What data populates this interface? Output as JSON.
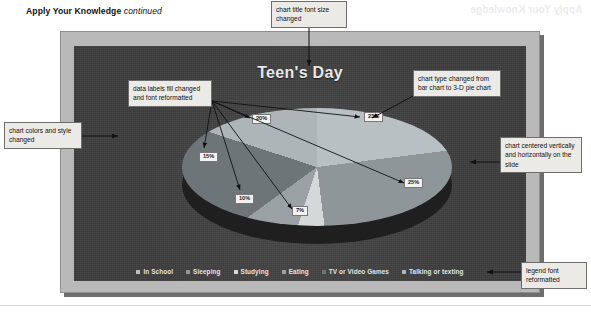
{
  "page": {
    "header_bold": "Apply Your Knowledge",
    "header_italic": "continued",
    "ghost_text": "Apply Your Knowledge"
  },
  "slide": {
    "chart_title": "Teen's Day",
    "background_color": "#3a3a3a"
  },
  "callouts": [
    {
      "name": "chart-title-font",
      "text": "chart title font size changed"
    },
    {
      "name": "chart-type",
      "text": "chart type changed from bar chart to 3-D pie chart"
    },
    {
      "name": "chart-centered",
      "text": "chart centered vertically and horizontally on the slide"
    },
    {
      "name": "chart-colors",
      "text": "chart colors and style changed"
    },
    {
      "name": "data-labels",
      "text": "data labels fill changed and font reformatted"
    },
    {
      "name": "legend-font",
      "text": "legend font reformatted"
    }
  ],
  "chart_data": {
    "type": "pie",
    "title": "Teen's Day",
    "three_d": true,
    "categories": [
      "In School",
      "Sleeping",
      "Studying",
      "Eating",
      "TV or Video Games",
      "Talking or texting"
    ],
    "values": [
      23,
      25,
      7,
      10,
      15,
      20
    ],
    "data_labels": [
      "23%",
      "25%",
      "7%",
      "10%",
      "15%",
      "20%"
    ],
    "colors": [
      "#b9c0c4",
      "#8f9699",
      "#d4d8d9",
      "#9aa1a4",
      "#6e7578",
      "#aeb5b8"
    ],
    "legend_position": "bottom",
    "grid": false,
    "xlabel": "",
    "ylabel": ""
  },
  "legend": [
    {
      "label": "In School",
      "color": "#b9c0c4"
    },
    {
      "label": "Sleeping",
      "color": "#8f9699"
    },
    {
      "label": "Studying",
      "color": "#d4d8d9"
    },
    {
      "label": "Eating",
      "color": "#9aa1a4"
    },
    {
      "label": "TV or Video Games",
      "color": "#6e7578"
    },
    {
      "label": "Talking or texting",
      "color": "#aeb5b8"
    }
  ],
  "data_label_positions": [
    {
      "value": "20%",
      "left": 252,
      "top": 114
    },
    {
      "value": "23%",
      "left": 364,
      "top": 112
    },
    {
      "value": "15%",
      "left": 199,
      "top": 152
    },
    {
      "value": "10%",
      "left": 235,
      "top": 194
    },
    {
      "value": "7%",
      "left": 292,
      "top": 206
    },
    {
      "value": "25%",
      "left": 404,
      "top": 178
    }
  ]
}
